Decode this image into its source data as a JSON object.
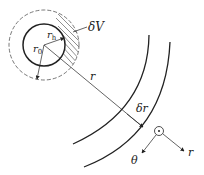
{
  "labels": {
    "delta_v": "δV",
    "r_h": "r",
    "r_h_sub": "h",
    "r_0": "r",
    "r_0_sub": "0",
    "r": "r",
    "delta_r": "δr",
    "theta": "θ",
    "r_axis": "r"
  },
  "colors": {
    "stroke": "#222222",
    "background": "#ffffff"
  }
}
